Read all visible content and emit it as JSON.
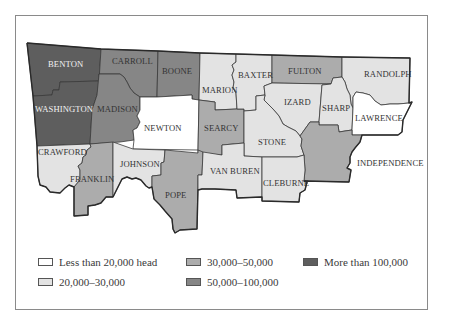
{
  "colors": {
    "lt20k": "#ffffff",
    "20k_30k": "#e3e3e3",
    "30k_50k": "#acacac",
    "50k_100k": "#868686",
    "gt100k": "#5e5e5e"
  },
  "legend": {
    "items": [
      {
        "key": "lt20k",
        "label": "Less than 20,000 head"
      },
      {
        "key": "20k_30k",
        "label": "20,000–30,000"
      },
      {
        "key": "30k_50k",
        "label": "30,000–50,000"
      },
      {
        "key": "50k_100k",
        "label": "50,000–100,000"
      },
      {
        "key": "gt100k",
        "label": "More than 100,000"
      }
    ]
  },
  "counties": [
    {
      "name": "BENTON",
      "class": "More than 100,000"
    },
    {
      "name": "CARROLL",
      "class": "50,000–100,000"
    },
    {
      "name": "BOONE",
      "class": "50,000–100,000"
    },
    {
      "name": "MARION",
      "class": "20,000–30,000"
    },
    {
      "name": "BAXTER",
      "class": "20,000–30,000"
    },
    {
      "name": "FULTON",
      "class": "30,000–50,000"
    },
    {
      "name": "RANDOLPH",
      "class": "20,000–30,000"
    },
    {
      "name": "WASHINGTON",
      "class": "More than 100,000"
    },
    {
      "name": "MADISON",
      "class": "50,000–100,000"
    },
    {
      "name": "NEWTON",
      "class": "Less than 20,000 head"
    },
    {
      "name": "SEARCY",
      "class": "30,000–50,000"
    },
    {
      "name": "IZARD",
      "class": "20,000–30,000"
    },
    {
      "name": "SHARP",
      "class": "20,000–30,000"
    },
    {
      "name": "LAWRENCE",
      "class": "Less than 20,000 head"
    },
    {
      "name": "STONE",
      "class": "20,000–30,000"
    },
    {
      "name": "INDEPENDENCE",
      "class": "30,000–50,000"
    },
    {
      "name": "CRAWFORD",
      "class": "20,000–30,000"
    },
    {
      "name": "FRANKLIN",
      "class": "30,000–50,000"
    },
    {
      "name": "JOHNSON",
      "class": "20,000–30,000"
    },
    {
      "name": "POPE",
      "class": "30,000–50,000"
    },
    {
      "name": "VAN BUREN",
      "class": "20,000–30,000"
    },
    {
      "name": "CLEBURNE",
      "class": "20,000–30,000"
    }
  ]
}
